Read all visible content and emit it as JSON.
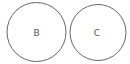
{
  "diagram": {
    "stroke_color": "#666666",
    "background": "#ffffff",
    "circles": [
      {
        "label": "B",
        "cx": 36.5,
        "cy": 32,
        "r": 29.5
      },
      {
        "label": "C",
        "cx": 98,
        "cy": 32.5,
        "r": 28
      }
    ]
  }
}
